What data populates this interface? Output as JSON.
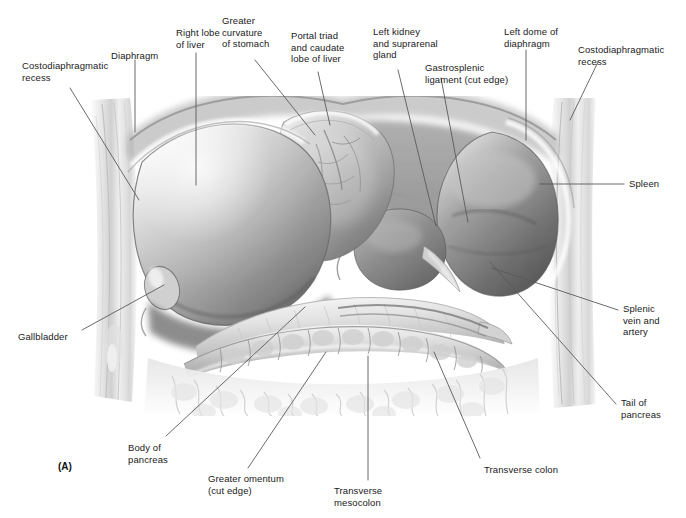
{
  "figure": {
    "letter": "(A)",
    "signature": "ZN",
    "caption_labels_font_color": "#1a1a1a",
    "leader_color": "#5a5a5a",
    "background": "#ffffff",
    "type": "anatomical-illustration"
  },
  "labels": [
    {
      "id": "costodiaphragmatic-recess-left",
      "text": "Costodiaphragmatic\nrecess",
      "x": 22,
      "y": 60,
      "align": "left"
    },
    {
      "id": "diaphragm",
      "text": "Diaphragm",
      "x": 111,
      "y": 50,
      "align": "left"
    },
    {
      "id": "right-lobe-of-liver",
      "text": "Right lobe\nof liver",
      "x": 176,
      "y": 27,
      "align": "left"
    },
    {
      "id": "greater-curvature-of-stomach",
      "text": "Greater\ncurvature\nof stomach",
      "x": 222,
      "y": 15,
      "align": "left"
    },
    {
      "id": "portal-triad-caudate-lobe",
      "text": "Portal triad\nand caudate\nlobe of liver",
      "x": 291,
      "y": 30,
      "align": "left"
    },
    {
      "id": "left-kidney-suprarenal-gland",
      "text": "Left kidney\nand suprarenal\ngland",
      "x": 373,
      "y": 26,
      "align": "left"
    },
    {
      "id": "gastrosplenic-ligament",
      "text": "Gastrosplenic\nligament (cut edge)",
      "x": 425,
      "y": 62,
      "align": "left"
    },
    {
      "id": "left-dome-of-diaphragm",
      "text": "Left dome of\ndiaphragm",
      "x": 504,
      "y": 26,
      "align": "left"
    },
    {
      "id": "costodiaphragmatic-recess-right",
      "text": "Costodiaphragmatic\nrecess",
      "x": 578,
      "y": 44,
      "align": "left"
    },
    {
      "id": "spleen",
      "text": "Spleen",
      "x": 629,
      "y": 178,
      "align": "left"
    },
    {
      "id": "splenic-vein-and-artery",
      "text": "Splenic\nvein and\nartery",
      "x": 623,
      "y": 303,
      "align": "left"
    },
    {
      "id": "tail-of-pancreas",
      "text": "Tail of\npancreas",
      "x": 621,
      "y": 397,
      "align": "left"
    },
    {
      "id": "gallbladder",
      "text": "Gallbladder",
      "x": 18,
      "y": 331,
      "align": "left"
    },
    {
      "id": "body-of-pancreas",
      "text": "Body of\npancreas",
      "x": 128,
      "y": 442,
      "align": "left"
    },
    {
      "id": "greater-omentum-cut-edge",
      "text": "Greater omentum\n(cut edge)",
      "x": 208,
      "y": 473,
      "align": "left"
    },
    {
      "id": "transverse-mesocolon",
      "text": "Transverse\nmesocolon",
      "x": 334,
      "y": 485,
      "align": "left"
    },
    {
      "id": "transverse-colon",
      "text": "Transverse colon",
      "x": 484,
      "y": 464,
      "align": "left"
    }
  ],
  "leaders": [
    {
      "id": "leader-costodiaphragmatic-recess-left",
      "points": "70,88 139,200"
    },
    {
      "id": "leader-diaphragm",
      "points": "135,60 135,132"
    },
    {
      "id": "leader-right-lobe-of-liver",
      "points": "196,53 196,185"
    },
    {
      "id": "leader-greater-curvature-of-stomach",
      "points": "255,60 315,135"
    },
    {
      "id": "leader-portal-triad",
      "points": "318,72 330,125"
    },
    {
      "id": "leader-left-kidney-suprarenal",
      "points": "398,70 436,226"
    },
    {
      "id": "leader-gastrosplenic-ligament",
      "points": "441,78 468,222"
    },
    {
      "id": "leader-left-dome-of-diaphragm",
      "points": "526,50 526,140"
    },
    {
      "id": "leader-costodiaphragmatic-recess-right",
      "points": "598,62 570,120"
    },
    {
      "id": "leader-spleen",
      "points": "624,184 540,184"
    },
    {
      "id": "leader-splenic-vein-artery",
      "points": "618,310 492,268"
    },
    {
      "id": "leader-tail-of-pancreas",
      "points": "616,404 490,262"
    },
    {
      "id": "leader-gallbladder",
      "points": "82,330 164,285"
    },
    {
      "id": "leader-body-of-pancreas",
      "points": "166,436 305,307"
    },
    {
      "id": "leader-greater-omentum",
      "points": "248,468 326,352"
    },
    {
      "id": "leader-transverse-mesocolon",
      "points": "368,480 368,356"
    },
    {
      "id": "leader-transverse-colon",
      "points": "480,458 434,352"
    }
  ]
}
